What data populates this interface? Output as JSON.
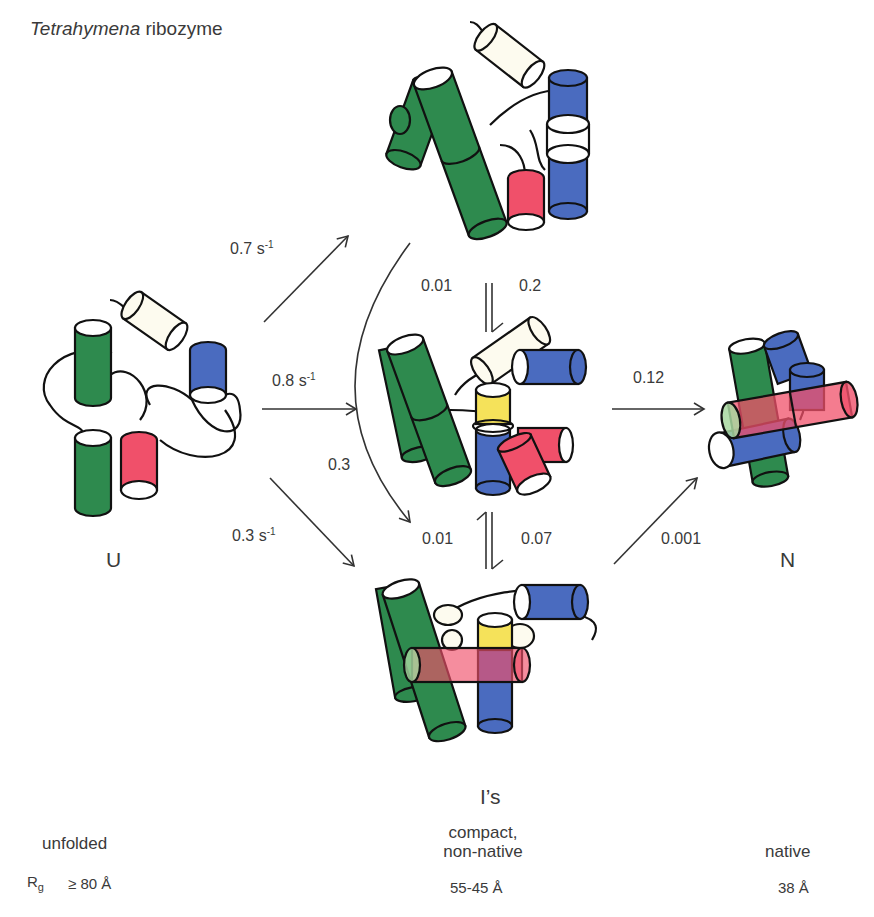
{
  "title": {
    "italic": "Tetrahymena",
    "rest": " ribozyme"
  },
  "states": {
    "U": {
      "label": "U",
      "description": "unfolded",
      "rg": "≥ 80 Å",
      "rg_prefix": "R",
      "rg_sub": "g"
    },
    "I": {
      "label": "I’s",
      "description_line1": "compact,",
      "description_line2": "non-native",
      "rg": "55-45 Å"
    },
    "N": {
      "label": "N",
      "description": "native",
      "rg": "38 Å"
    }
  },
  "rates": {
    "u_to_itop": {
      "value": "0.7 s",
      "sup": "-1"
    },
    "u_to_imid": {
      "value": "0.8 s",
      "sup": "-1"
    },
    "u_to_ibot": {
      "value": "0.3 s",
      "sup": "-1"
    },
    "itop_to_imid_forward": "0.2",
    "itop_to_imid_reverse": "0.01",
    "itop_to_ibot_curved": "0.3",
    "imid_to_ibot_forward": "0.07",
    "imid_to_ibot_reverse": "0.01",
    "imid_to_n": "0.12",
    "ibot_to_n": "0.001"
  },
  "colors": {
    "green": "#2e8a4e",
    "blue": "#4a6bbf",
    "red": "#f0506a",
    "yellow": "#f5e25a",
    "cream": "#fdfbef",
    "stroke": "#111111",
    "arrow": "#333333"
  }
}
